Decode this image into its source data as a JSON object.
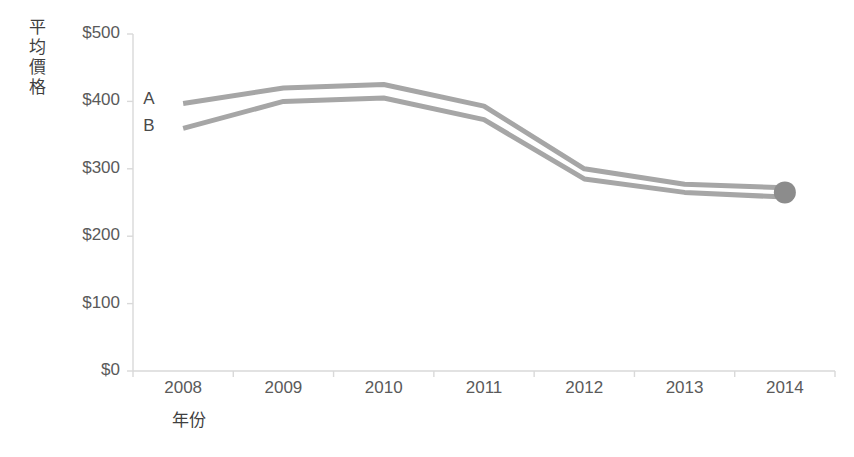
{
  "chart_data": {
    "type": "line",
    "title": "",
    "xlabel": "年份",
    "ylabel": "平均價格",
    "categories": [
      "2008",
      "2009",
      "2010",
      "2011",
      "2012",
      "2013",
      "2014"
    ],
    "x": [
      2008,
      2009,
      2010,
      2011,
      2012,
      2013,
      2014
    ],
    "series": [
      {
        "name": "A",
        "values": [
          397,
          420,
          425,
          393,
          300,
          277,
          272
        ],
        "color": "#a6a6a6"
      },
      {
        "name": "B",
        "values": [
          360,
          400,
          405,
          373,
          285,
          265,
          258
        ],
        "color": "#a6a6a6"
      }
    ],
    "ylim": [
      0,
      500
    ],
    "ytick_labels": [
      "$0",
      "$100",
      "$200",
      "$300",
      "$400",
      "$500"
    ],
    "ytick_values": [
      0,
      100,
      200,
      300,
      400,
      500
    ],
    "grid": false,
    "legend": "inline-labels",
    "marker": {
      "at_x": 2014,
      "shape": "circle",
      "color": "#8c8c8c"
    },
    "axis_color": "#d9d9d9"
  },
  "labels": {
    "series_a": "A",
    "series_b": "B"
  }
}
